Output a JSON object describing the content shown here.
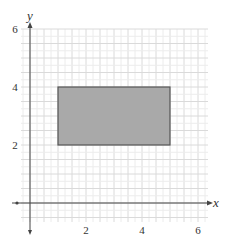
{
  "chart_data": {
    "type": "diagram-coordinate-plane",
    "title": "",
    "xlabel": "x",
    "ylabel": "y",
    "xlim": [
      -0.3,
      6.4
    ],
    "ylim": [
      -0.65,
      6.0
    ],
    "x_ticks": [
      {
        "value": 2,
        "label": "2"
      },
      {
        "value": 4,
        "label": "4"
      },
      {
        "value": 6,
        "label": "6"
      }
    ],
    "y_ticks": [
      {
        "value": 2,
        "label": "2"
      },
      {
        "value": 4,
        "label": "4"
      },
      {
        "value": 6,
        "label": "6"
      }
    ],
    "grid": {
      "on": true,
      "minor_step": 0.25,
      "major_step": 0.5
    },
    "shapes": [
      {
        "type": "rectangle",
        "vertices": [
          [
            1,
            2
          ],
          [
            5,
            2
          ],
          [
            5,
            4
          ],
          [
            1,
            4
          ]
        ],
        "x_range": [
          1,
          5
        ],
        "y_range": [
          2,
          4
        ],
        "fill": "#a9a9a9",
        "stroke": "#555555"
      }
    ]
  },
  "colors": {
    "grid_minor": "#ececec",
    "grid_major": "#dadada",
    "axis": "#444444",
    "rect_fill": "#a9a9a9",
    "rect_stroke": "#555555"
  }
}
